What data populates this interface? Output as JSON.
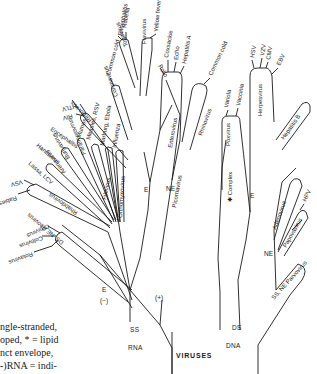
{
  "diagram": {
    "title": "VIRUSES",
    "bases": {
      "rna": {
        "strand": "SS",
        "type": "RNA"
      },
      "dna": {
        "strand": "DS",
        "type": "DNA"
      }
    },
    "group_labels": {
      "rna_e_minus_env": "E",
      "rna_minus": "(−)",
      "rna_plus": "(+)",
      "rna_plus_e": "E",
      "rna_plus_ne": "NE",
      "dna_e": "E",
      "dna_ne": "NE"
    },
    "families": {
      "ds_ne_reovirus": "DS, NE Reovirus",
      "rhabdovirus": "Rhabdovirus",
      "arenavirus": "Arenavirus",
      "bunyavirus": "Bunyavirus",
      "paramyxovirus": "Paramyxovirus",
      "filovirus": "Filovirus",
      "orthomyxovirus": "Orthomyxovirus",
      "retrovirus": "Retrovirus",
      "coronavirus": "Coronavirus",
      "togavirus": "Togavirus",
      "flavivirus": "Flavivirus",
      "picornavirus": "Picornavirus",
      "enterovirus": "Enterovirus",
      "rhinovirus": "Rhinovirus",
      "poxvirus": "Poxvirus",
      "complex": "✱ Complex",
      "herpesvirus": "Herpesvirus",
      "hepatitis_b": "Hepatitis B",
      "adenovirus": "Adenovirus",
      "papovavirus": "Papovavirus",
      "ss_ne_parvovirus": "SS, NE Parvovirus"
    },
    "leaves": {
      "rotavirus": "Rotavirus",
      "coltivirus": "Coltivirus",
      "reovirus_orbivirus": "Orbivirus",
      "rabies": "Rabies",
      "vsv": "VSV",
      "lassa_lcv": "Lassa, LCV",
      "hantavirus": "Hantavirus",
      "encephalitis_bunya": "Encephalitis",
      "mumps": "Mumps",
      "measles_rsv": "Measles, RSV",
      "marburg_ebola": "Marburg, Ebola",
      "influenza": "Influenza",
      "hiv": "HIV",
      "htlv": "HTLV",
      "common_cold_corona": "Common cold",
      "rubella": "Rubella",
      "encephalitis_toga": "Encephalitis",
      "yellow_fever": "Yellow fever",
      "polio": "Polio",
      "coxsackie": "Coxsackie",
      "echo": "Echo",
      "hepatitis_a": "Hepatitis A",
      "common_cold_rhino": "Common cold",
      "variola": "Variola",
      "vaccinia": "Vaccinia",
      "hsv": "HSV",
      "vzv": "VZV",
      "cmv": "CMV",
      "ebv": "EBV",
      "hpv": "HPV"
    }
  },
  "caption": {
    "lines": [
      "ngle-stranded,",
      "oped, * = lipid",
      "nct   envelope,",
      "-)RNA = indi-"
    ]
  }
}
